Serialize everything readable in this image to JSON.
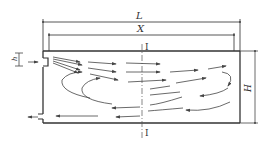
{
  "diagram": {
    "labels": {
      "length": "L",
      "distance": "X",
      "height": "H",
      "inlet_height": "h",
      "section_top": "I",
      "section_bottom": "I"
    },
    "colors": {
      "line": "#3a3a3a",
      "arrow": "#444444"
    }
  }
}
